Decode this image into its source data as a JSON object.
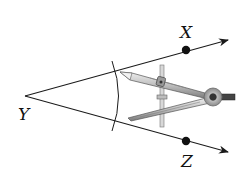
{
  "diagram": {
    "vertex": {
      "label": "Y",
      "x": 25,
      "y": 96
    },
    "points": [
      {
        "label": "X",
        "x": 186,
        "y": 50,
        "label_x": 180,
        "label_y": 38
      },
      {
        "label": "Z",
        "x": 186,
        "y": 141,
        "label_x": 181,
        "label_y": 167
      }
    ],
    "rays": [
      {
        "name": "ray-YX",
        "from": [
          25,
          96
        ],
        "to": [
          229,
          40
        ]
      },
      {
        "name": "ray-YZ",
        "from": [
          25,
          96
        ],
        "to": [
          229,
          152
        ]
      }
    ],
    "arc": {
      "center": [
        25,
        96
      ],
      "radius": 95
    },
    "colors": {
      "line": "#1a1a1a",
      "compass_dark": "#555555",
      "compass_mid": "#9a9a9a",
      "compass_light": "#d4d4d4",
      "point": "#111111"
    }
  }
}
